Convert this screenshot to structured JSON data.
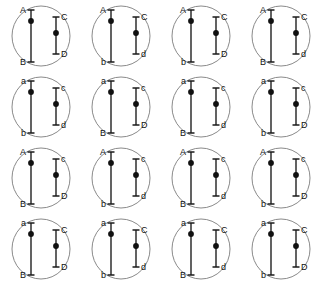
{
  "figure": {
    "rows": 4,
    "columns": 4,
    "cell_count": 16,
    "colors": {
      "background": "#ffffff",
      "membrane": "#8a8a8a",
      "chromosome": "#3b3b3b",
      "centromere": "#111111",
      "label": "#111111"
    }
  },
  "cells": [
    {
      "index": 1,
      "row": 1,
      "col": 1,
      "long_chromosome": {
        "top_allele": "A",
        "bottom_allele": "B"
      },
      "short_chromosome": {
        "top_allele": "C",
        "bottom_allele": "D"
      },
      "genotype": "AB CD"
    },
    {
      "index": 2,
      "row": 1,
      "col": 2,
      "long_chromosome": {
        "top_allele": "A",
        "bottom_allele": "b"
      },
      "short_chromosome": {
        "top_allele": "C",
        "bottom_allele": "d"
      },
      "genotype": "Ab Cd"
    },
    {
      "index": 3,
      "row": 1,
      "col": 3,
      "long_chromosome": {
        "top_allele": "A",
        "bottom_allele": "b"
      },
      "short_chromosome": {
        "top_allele": "C",
        "bottom_allele": "D"
      },
      "genotype": "Ab CD"
    },
    {
      "index": 4,
      "row": 1,
      "col": 4,
      "long_chromosome": {
        "top_allele": "A",
        "bottom_allele": "B"
      },
      "short_chromosome": {
        "top_allele": "C",
        "bottom_allele": "d"
      },
      "genotype": "AB Cd"
    },
    {
      "index": 5,
      "row": 2,
      "col": 1,
      "long_chromosome": {
        "top_allele": "a",
        "bottom_allele": "b"
      },
      "short_chromosome": {
        "top_allele": "c",
        "bottom_allele": "d"
      },
      "genotype": "ab cd"
    },
    {
      "index": 6,
      "row": 2,
      "col": 2,
      "long_chromosome": {
        "top_allele": "a",
        "bottom_allele": "B"
      },
      "short_chromosome": {
        "top_allele": "c",
        "bottom_allele": "D"
      },
      "genotype": "aB cD"
    },
    {
      "index": 7,
      "row": 2,
      "col": 3,
      "long_chromosome": {
        "top_allele": "a",
        "bottom_allele": "B"
      },
      "short_chromosome": {
        "top_allele": "c",
        "bottom_allele": "d"
      },
      "genotype": "aB cd"
    },
    {
      "index": 8,
      "row": 2,
      "col": 4,
      "long_chromosome": {
        "top_allele": "a",
        "bottom_allele": "b"
      },
      "short_chromosome": {
        "top_allele": "c",
        "bottom_allele": "D"
      },
      "genotype": "ab cD"
    },
    {
      "index": 9,
      "row": 3,
      "col": 1,
      "long_chromosome": {
        "top_allele": "A",
        "bottom_allele": "B"
      },
      "short_chromosome": {
        "top_allele": "c",
        "bottom_allele": "D"
      },
      "genotype": "AB cD"
    },
    {
      "index": 10,
      "row": 3,
      "col": 2,
      "long_chromosome": {
        "top_allele": "A",
        "bottom_allele": "b"
      },
      "short_chromosome": {
        "top_allele": "c",
        "bottom_allele": "d"
      },
      "genotype": "Ab cd"
    },
    {
      "index": 11,
      "row": 3,
      "col": 3,
      "long_chromosome": {
        "top_allele": "A",
        "bottom_allele": "B"
      },
      "short_chromosome": {
        "top_allele": "c",
        "bottom_allele": "d"
      },
      "genotype": "AB cd"
    },
    {
      "index": 12,
      "row": 3,
      "col": 4,
      "long_chromosome": {
        "top_allele": "A",
        "bottom_allele": "b"
      },
      "short_chromosome": {
        "top_allele": "c",
        "bottom_allele": "D"
      },
      "genotype": "Ab cD"
    },
    {
      "index": 13,
      "row": 4,
      "col": 1,
      "long_chromosome": {
        "top_allele": "a",
        "bottom_allele": "B"
      },
      "short_chromosome": {
        "top_allele": "C",
        "bottom_allele": "D"
      },
      "genotype": "aB CD"
    },
    {
      "index": 14,
      "row": 4,
      "col": 2,
      "long_chromosome": {
        "top_allele": "a",
        "bottom_allele": "b"
      },
      "short_chromosome": {
        "top_allele": "C",
        "bottom_allele": "d"
      },
      "genotype": "ab Cd"
    },
    {
      "index": 15,
      "row": 4,
      "col": 3,
      "long_chromosome": {
        "top_allele": "a",
        "bottom_allele": "B"
      },
      "short_chromosome": {
        "top_allele": "C",
        "bottom_allele": "d"
      },
      "genotype": "aB Cd"
    },
    {
      "index": 16,
      "row": 4,
      "col": 4,
      "long_chromosome": {
        "top_allele": "a",
        "bottom_allele": "b"
      },
      "short_chromosome": {
        "top_allele": "C",
        "bottom_allele": "D"
      },
      "genotype": "ab CD"
    }
  ]
}
